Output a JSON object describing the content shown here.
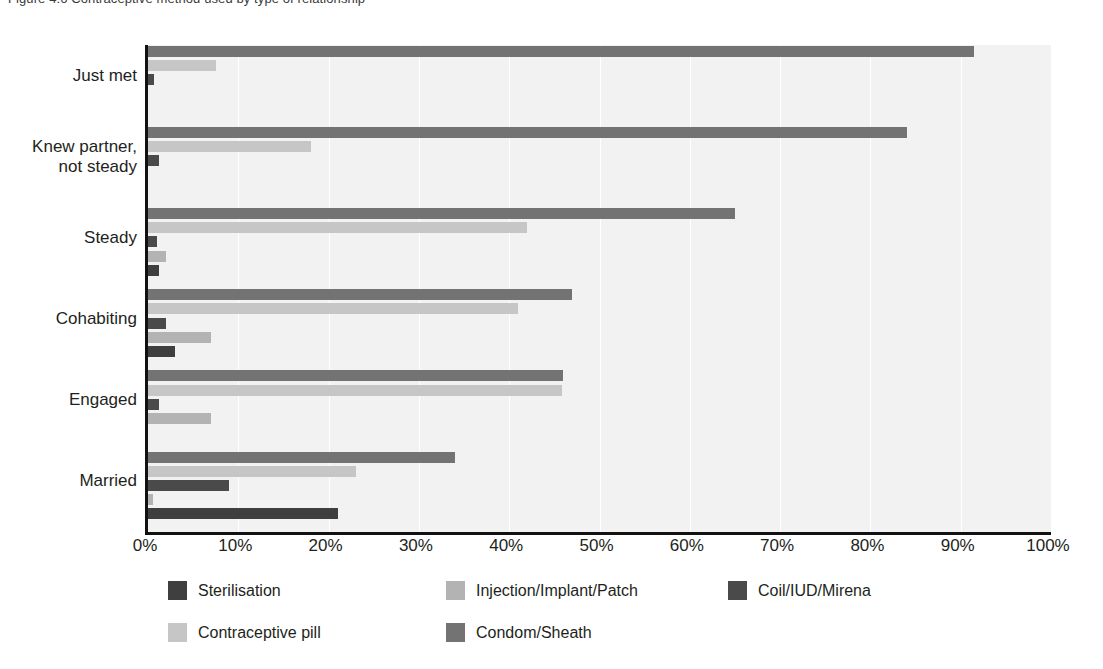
{
  "top_caption": "Figure 4.6 Contraceptive method used by type of relationship",
  "chart_data": {
    "type": "bar",
    "orientation": "horizontal",
    "title": "",
    "xlabel": "",
    "ylabel": "",
    "xlim": [
      0,
      100
    ],
    "xticks": [
      "0%",
      "10%",
      "20%",
      "30%",
      "40%",
      "50%",
      "60%",
      "70%",
      "80%",
      "90%",
      "100%"
    ],
    "xtick_values": [
      0,
      10,
      20,
      30,
      40,
      50,
      60,
      70,
      80,
      90,
      100
    ],
    "grid": true,
    "grid_axis": "x",
    "legend_position": "bottom",
    "categories": [
      "Just met",
      "Knew partner,\nnot steady",
      "Steady",
      "Cohabiting",
      "Engaged",
      "Married"
    ],
    "category_labels": [
      [
        "Just met"
      ],
      [
        "Knew partner,",
        "not steady"
      ],
      [
        "Steady"
      ],
      [
        "Cohabiting"
      ],
      [
        "Engaged"
      ],
      [
        "Married"
      ]
    ],
    "series": [
      {
        "name": "Condom/Sheath",
        "color": "#737373",
        "values": [
          91.5,
          84.0,
          65.0,
          47.0,
          46.0,
          34.0
        ]
      },
      {
        "name": "Contraceptive pill",
        "color": "#c6c6c6",
        "values": [
          7.5,
          18.0,
          42.0,
          41.0,
          45.8,
          23.0
        ]
      },
      {
        "name": "Coil/IUD/Mirena",
        "color": "#4a4a4a",
        "values": [
          0.7,
          1.2,
          1.0,
          2.0,
          1.2,
          9.0
        ]
      },
      {
        "name": "Injection/Implant/Patch",
        "color": "#b3b3b3",
        "values": [
          0.0,
          0.0,
          2.0,
          7.0,
          7.0,
          0.6
        ]
      },
      {
        "name": "Sterilisation",
        "color": "#3f3f3f",
        "values": [
          0.0,
          0.0,
          1.2,
          3.0,
          0.0,
          21.0
        ]
      }
    ],
    "series_draw_order": [
      "Condom/Sheath",
      "Contraceptive pill",
      "Coil/IUD/Mirena",
      "Injection/Implant/Patch",
      "Sterilisation"
    ]
  },
  "legend": {
    "items": [
      {
        "label": "Sterilisation",
        "color": "#3f3f3f"
      },
      {
        "label": "Injection/Implant/Patch",
        "color": "#b3b3b3"
      },
      {
        "label": "Coil/IUD/Mirena",
        "color": "#4a4a4a"
      },
      {
        "label": "Contraceptive pill",
        "color": "#c6c6c6"
      },
      {
        "label": "Condom/Sheath",
        "color": "#737373"
      }
    ]
  },
  "colors": {
    "plot_background": "#f2f2f2",
    "gridline": "#ffffff",
    "axis": "#111111",
    "text": "#231f20"
  }
}
